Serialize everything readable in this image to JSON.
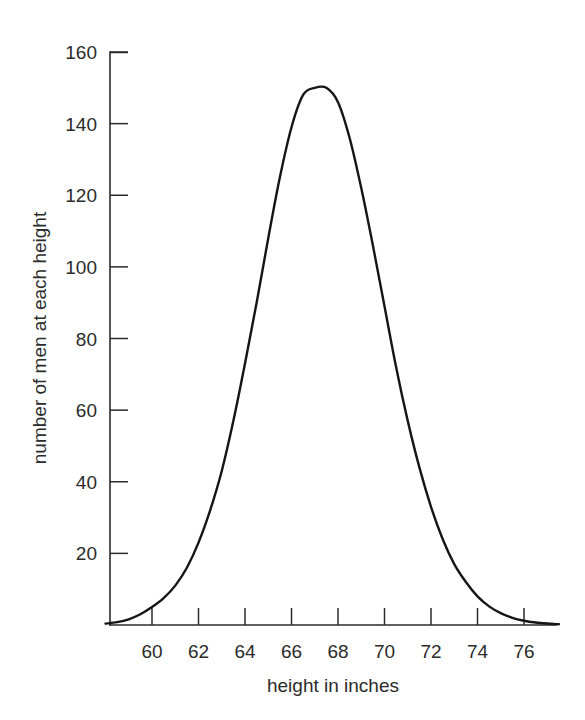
{
  "chart_data": {
    "type": "line",
    "title": "",
    "subtitle": "",
    "xlabel": "height in inches",
    "ylabel": "number of men at each height",
    "xlim": [
      58,
      77.5
    ],
    "ylim": [
      0,
      160
    ],
    "xticks": [
      60,
      62,
      64,
      66,
      68,
      70,
      72,
      74,
      76
    ],
    "xtick_labels": [
      "60",
      "62",
      "64",
      "66",
      "68",
      "70",
      "72",
      "74",
      "76"
    ],
    "yticks": [
      20,
      40,
      60,
      80,
      100,
      120,
      140,
      160
    ],
    "ytick_labels": [
      "20",
      "40",
      "60",
      "80",
      "100",
      "120",
      "140",
      "160"
    ],
    "grid": false,
    "legend": null,
    "annotations": [],
    "series": [
      {
        "name": "number of men at each height",
        "color": "#151515",
        "peak_x": 67.5,
        "peak_y": 150,
        "x": [
          58.0,
          58.5,
          59.0,
          59.5,
          60.0,
          60.5,
          61.0,
          61.5,
          62.0,
          62.5,
          63.0,
          63.5,
          64.0,
          64.5,
          65.0,
          65.5,
          66.0,
          66.5,
          67.0,
          67.5,
          68.0,
          68.5,
          69.0,
          69.5,
          70.0,
          70.5,
          71.0,
          71.5,
          72.0,
          72.5,
          73.0,
          73.5,
          74.0,
          74.5,
          75.0,
          75.5,
          76.0,
          76.5,
          77.0,
          77.5
        ],
        "y": [
          0.4,
          0.8,
          1.6,
          3.0,
          5.0,
          7.5,
          11.0,
          16.0,
          23.0,
          32.0,
          43.0,
          57.0,
          73.0,
          90.0,
          108.0,
          125.0,
          139.0,
          148.0,
          150.0,
          150.0,
          146.0,
          136.0,
          122.0,
          106.0,
          89.0,
          72.0,
          57.0,
          44.0,
          33.0,
          24.0,
          17.0,
          12.0,
          8.0,
          5.2,
          3.3,
          2.0,
          1.2,
          0.7,
          0.4,
          0.2
        ]
      }
    ]
  },
  "axes": {
    "x_axis_name": "height in inches",
    "y_axis_name": "number of men at each height"
  },
  "colors": {
    "curve": "#151515",
    "axis": "#2b2b2b",
    "background": "#ffffff"
  }
}
